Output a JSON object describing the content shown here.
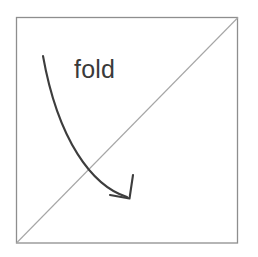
{
  "figure": {
    "background_color": "#ffffff",
    "canvas": {
      "width": 258,
      "height": 257
    },
    "label": {
      "text": "fold",
      "x": 74,
      "y": 78,
      "font_size": 25,
      "color": "#3a3a3a"
    },
    "square": {
      "name": "paper-square",
      "left": 16,
      "top": 17,
      "right": 238,
      "bottom": 243,
      "stroke_color": "#8e8e8e",
      "stroke_width": 1.3,
      "fill": "#ffffff"
    },
    "diagonal": {
      "name": "fold-crease-line",
      "x1": 16,
      "y1": 243,
      "x2": 238,
      "y2": 17,
      "stroke_color": "#a6a6a6",
      "stroke_width": 1.1
    },
    "arrow": {
      "name": "fold-direction-arrow",
      "start": {
        "x": 43,
        "y": 56
      },
      "end": {
        "x": 129,
        "y": 198
      },
      "control1": {
        "x": 58,
        "y": 140
      },
      "control2": {
        "x": 92,
        "y": 186
      },
      "stroke_color": "#3d3d3d",
      "stroke_width": 2.1,
      "head": {
        "tip": {
          "x": 129,
          "y": 198
        },
        "barb_left": {
          "x": 111,
          "y": 196
        },
        "barb_right": {
          "x": 134,
          "y": 176
        }
      }
    }
  }
}
